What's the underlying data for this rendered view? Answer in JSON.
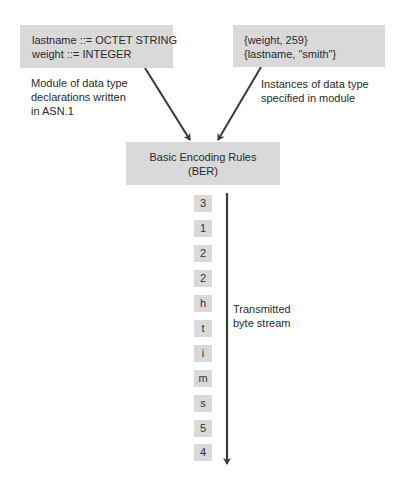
{
  "declarations_box": {
    "lines": [
      "lastname ::= OCTET STRING",
      "weight ::= INTEGER"
    ],
    "caption": [
      "Module of data type",
      "declarations written",
      "in ASN.1"
    ]
  },
  "instances_box": {
    "lines": [
      "{weight, 259}",
      "{lastname, \"smith\"}"
    ],
    "caption": [
      "Instances of data type",
      "specified in module"
    ]
  },
  "encoder_box": {
    "lines": [
      "Basic Encoding Rules",
      "(BER)"
    ]
  },
  "byte_stream": {
    "caption": [
      "Transmitted",
      "byte stream"
    ],
    "bytes": [
      "3",
      "1",
      "2",
      "2",
      "h",
      "t",
      "i",
      "m",
      "s",
      "5",
      "4"
    ]
  },
  "colors": {
    "box_fill": "#d9d9d9",
    "arrow": "#3a3a3a",
    "text": "#2a2a2a"
  }
}
